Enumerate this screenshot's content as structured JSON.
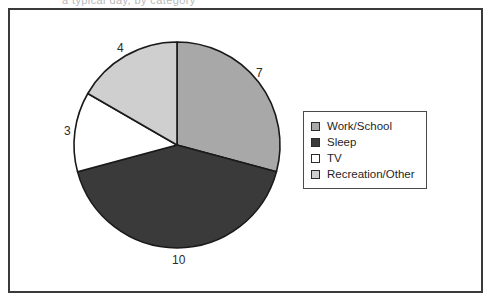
{
  "top_clip_text": "a typical day, by category",
  "chart_data": {
    "type": "pie",
    "title": "",
    "total": 24,
    "start_angle_deg": 0,
    "direction": "clockwise",
    "legend_position": "right",
    "grid": false,
    "categories": [
      "Work/School",
      "Sleep",
      "TV",
      "Recreation/Other"
    ],
    "values": [
      7,
      10,
      3,
      4
    ],
    "colors": [
      "#a8a8a8",
      "#3a3a3a",
      "#ffffff",
      "#cfcfcf"
    ],
    "slice_edge_color": "#1a1a1a",
    "labels": [
      {
        "text": "7",
        "category": "Work/School",
        "value": 7
      },
      {
        "text": "10",
        "category": "Sleep",
        "value": 10
      },
      {
        "text": "3",
        "category": "TV",
        "value": 3
      },
      {
        "text": "4",
        "category": "Recreation/Other",
        "value": 4
      }
    ]
  },
  "legend": {
    "items": [
      {
        "label": "Work/School",
        "color": "#a8a8a8"
      },
      {
        "label": "Sleep",
        "color": "#3a3a3a"
      },
      {
        "label": "TV",
        "color": "#ffffff"
      },
      {
        "label": "Recreation/Other",
        "color": "#cfcfcf"
      }
    ]
  },
  "frame": {
    "border_color": "#3a3a3a"
  }
}
